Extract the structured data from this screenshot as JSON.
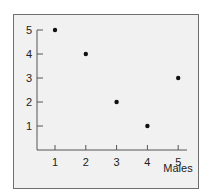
{
  "chart_data": {
    "type": "scatter",
    "title": "",
    "xlabel": "Males",
    "ylabel": "",
    "x": [
      1,
      2,
      3,
      4,
      5
    ],
    "y": [
      5,
      4,
      2,
      1,
      3
    ],
    "series": [
      {
        "name": "",
        "points": [
          [
            1,
            5
          ],
          [
            2,
            4
          ],
          [
            3,
            2
          ],
          [
            4,
            1
          ],
          [
            5,
            3
          ]
        ]
      }
    ],
    "xticks": [
      "1",
      "2",
      "3",
      "4",
      "5"
    ],
    "yticks": [
      "1",
      "2",
      "3",
      "4",
      "5"
    ],
    "xlim": [
      0.4,
      5.3
    ],
    "ylim": [
      0,
      5
    ],
    "grid": false,
    "legend": null
  },
  "colors": {
    "background": "#f1f1f1",
    "border": "#6e6e6e",
    "axis": "#555555",
    "point": "#111111",
    "text": "#222222"
  }
}
